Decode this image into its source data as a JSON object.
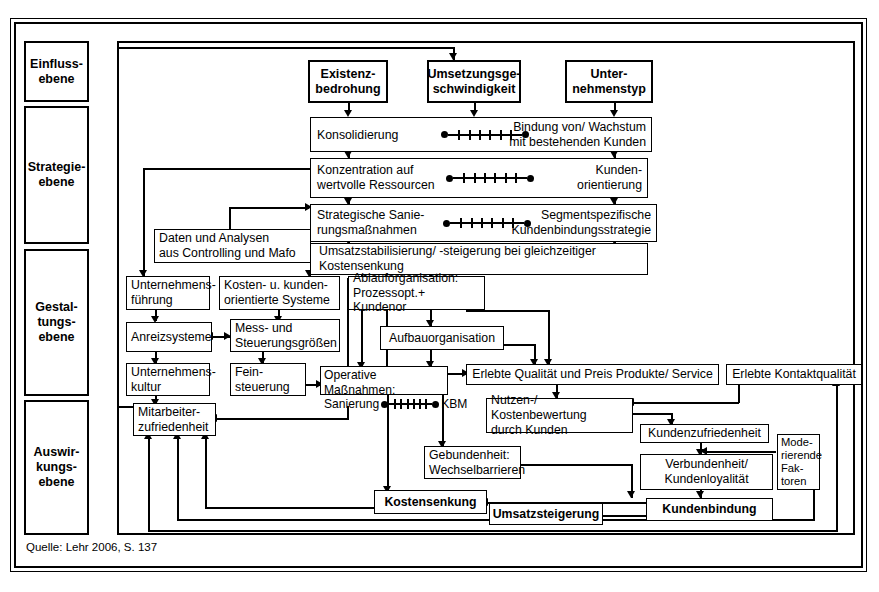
{
  "diagram": {
    "source_note": "Quelle: Lehr 2006, S. 137",
    "levels": [
      {
        "id": "einfluss",
        "label": "Einfluss-\nebene"
      },
      {
        "id": "strategie",
        "label": "Strategie-\nebene"
      },
      {
        "id": "gestaltung",
        "label": "Gestal-\ntungs-\nebene"
      },
      {
        "id": "auswirkung",
        "label": "Auswir-\nkungs-\nebene"
      }
    ],
    "influence_boxes": [
      {
        "id": "existenzbedrohung",
        "label": "Existenz-\nbedrohung"
      },
      {
        "id": "umsetzungsgeschwindigkeit",
        "label": "Umsetzungsge-\nschwindigkeit"
      },
      {
        "id": "unternehmenstyp",
        "label": "Unter-\nnehmenstyp"
      }
    ],
    "strategy_bars": [
      {
        "id": "konsolidierung",
        "left_label": "Konsolidierung",
        "right_label": "Bindung von/ Wachstum\nmit bestehenden Kunden",
        "scale_ticks": 6
      },
      {
        "id": "konzentration",
        "left_label": "Konzentration auf\nwertvolle Ressourcen",
        "right_label": "Kunden-\norientierung",
        "scale_ticks": 6
      },
      {
        "id": "sanierung",
        "left_label": "Strategische Sanie-\nrungsmaßnahmen",
        "right_label": "Segmentspezifische\nKundenbindungsstrategie",
        "scale_ticks": 6
      },
      {
        "id": "umsatzstabilisierung",
        "left_label": "Umsatzstabilisierung/ -steigerung bei gleichzeitiger\nKostensenkung",
        "right_label": "",
        "scale_ticks": 0
      }
    ],
    "design_boxes": [
      {
        "id": "daten-analysen",
        "label": "Daten und Analysen\naus Controlling und Mafo"
      },
      {
        "id": "unternehmensfuehrung",
        "label": "Unternehmens-\nführung"
      },
      {
        "id": "kosten-kundenorientierte-systeme",
        "label": "Kosten- u. kunden-\norientierte Systeme"
      },
      {
        "id": "ablauforganisation",
        "label": "Ablauforganisation:\nProzessopt.+ Kundenor"
      },
      {
        "id": "anreizsysteme",
        "label": "Anreizsysteme"
      },
      {
        "id": "mess-steuerungsgroessen",
        "label": "Mess- und\nSteuerungsgrößen"
      },
      {
        "id": "aufbauorganisation",
        "label": "Aufbauorganisation"
      },
      {
        "id": "unternehmenskultur",
        "label": "Unternehmens-\nkultur"
      },
      {
        "id": "feinsteuerung",
        "label": "Fein-\nsteuerung"
      },
      {
        "id": "operative-massnahmen",
        "label_line1": "Operative Maßnahmen:",
        "label_left": "Sanierung",
        "label_right": "KBM",
        "scale_ticks": 6
      },
      {
        "id": "erlebte-qualitaet",
        "label": "Erlebte Qualität und Preis Produkte/ Service"
      },
      {
        "id": "erlebte-kontaktqualitaet",
        "label": "Erlebte Kontaktqualität"
      }
    ],
    "effect_boxes": [
      {
        "id": "mitarbeiterzufriedenheit",
        "label": "Mitarbeiter-\nzufriedenheit"
      },
      {
        "id": "nutzen-kostenbewertung",
        "label": "Nutzen-/ Kostenbewertung\ndurch Kunden"
      },
      {
        "id": "kundenzufriedenheit",
        "label": "Kundenzufriedenheit"
      },
      {
        "id": "moderierende-faktoren",
        "label": "Mode-\nrierende\nFak-\ntoren"
      },
      {
        "id": "gebundenheit",
        "label": "Gebundenheit:\nWechselbarrieren"
      },
      {
        "id": "verbundenheit",
        "label": "Verbundenheit/\nKundenloyalität"
      },
      {
        "id": "kostensenkung",
        "label": "Kostensenkung"
      },
      {
        "id": "umsatzsteigerung",
        "label": "Umsatzsteigerung"
      },
      {
        "id": "kundenbindung",
        "label": "Kundenbindung"
      }
    ],
    "colors": {
      "stroke": "#000000",
      "background": "#ffffff"
    }
  }
}
